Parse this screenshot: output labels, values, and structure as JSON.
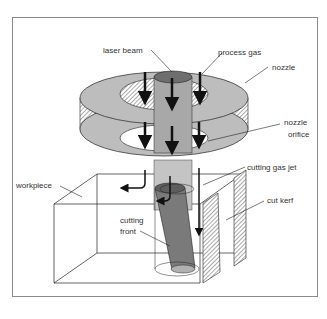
{
  "diagram": {
    "type": "laser cutting process schematic",
    "labels": {
      "laser_beam": "laser beam",
      "process_gas": "process gas",
      "nozzle": "nozzle",
      "nozzle_orifice_1": "nozzle",
      "nozzle_orifice_2": "orifice",
      "cutting_gas_jet": "cutting gas jet",
      "workpiece": "workpiece",
      "cut_kerf": "cut kerf",
      "cutting_front_1": "cutting",
      "cutting_front_2": "front"
    },
    "colors": {
      "nozzle_fill": "#bdbdbd",
      "beam_fill": "#a8a8a8",
      "beam_top": "#6e6e6e",
      "front_fill": "#7a7a7a",
      "line": "#222222",
      "frame": "#8a8a8a"
    }
  }
}
